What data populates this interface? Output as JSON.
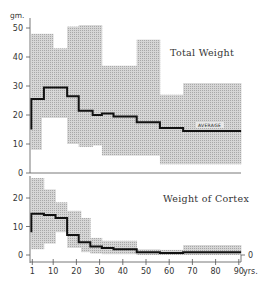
{
  "chart_data": [
    {
      "type": "area",
      "title": "Total Weight",
      "ylabel": "gm.",
      "xlabel": "yrs.",
      "ylim": [
        0,
        52
      ],
      "yticks": [
        0,
        10,
        20,
        30,
        40,
        50
      ],
      "annotation": "AVERAGE",
      "band": {
        "description": "shaded range (min–max)",
        "steps": [
          {
            "x0": 1,
            "x1": 5,
            "low": 8,
            "high": 48
          },
          {
            "x0": 5,
            "x1": 10,
            "low": 19,
            "high": 48
          },
          {
            "x0": 10,
            "x1": 16,
            "low": 19,
            "high": 43
          },
          {
            "x0": 16,
            "x1": 21,
            "low": 10,
            "high": 50.5
          },
          {
            "x0": 21,
            "x1": 27,
            "low": 9,
            "high": 51
          },
          {
            "x0": 27,
            "x1": 31,
            "low": 9.5,
            "high": 51
          },
          {
            "x0": 31,
            "x1": 46,
            "low": 6,
            "high": 37
          },
          {
            "x0": 46,
            "x1": 56,
            "low": 6,
            "high": 46
          },
          {
            "x0": 56,
            "x1": 66,
            "low": 3,
            "high": 27
          },
          {
            "x0": 66,
            "x1": 91,
            "low": 3,
            "high": 31
          }
        ]
      },
      "average": [
        {
          "x0": 1,
          "x1": 6,
          "y": 25.5
        },
        {
          "x0": 6,
          "x1": 16,
          "y": 29.5
        },
        {
          "x0": 16,
          "x1": 21,
          "y": 26.5
        },
        {
          "x0": 21,
          "x1": 27,
          "y": 21.5
        },
        {
          "x0": 27,
          "x1": 31,
          "y": 20
        },
        {
          "x0": 31,
          "x1": 36,
          "y": 20.5
        },
        {
          "x0": 36,
          "x1": 46,
          "y": 19.5
        },
        {
          "x0": 46,
          "x1": 56,
          "y": 17.5
        },
        {
          "x0": 56,
          "x1": 66,
          "y": 15.5
        },
        {
          "x0": 66,
          "x1": 91,
          "y": 14.5
        }
      ],
      "average_start": 15
    },
    {
      "type": "area",
      "title": "Weight of Cortex",
      "ylabel": "",
      "xlabel": "yrs.",
      "ylim": [
        0,
        28
      ],
      "yticks": [
        0,
        10,
        20
      ],
      "right_label": "0",
      "band": {
        "steps": [
          {
            "x0": 1,
            "x1": 6,
            "low": 2,
            "high": 27
          },
          {
            "x0": 6,
            "x1": 11,
            "low": 4,
            "high": 23
          },
          {
            "x0": 11,
            "x1": 16,
            "low": 8,
            "high": 18.5
          },
          {
            "x0": 16,
            "x1": 22,
            "low": 2.5,
            "high": 15.5
          },
          {
            "x0": 22,
            "x1": 26,
            "low": 1,
            "high": 13
          },
          {
            "x0": 26,
            "x1": 31,
            "low": 0.5,
            "high": 6
          },
          {
            "x0": 31,
            "x1": 46,
            "low": 0.3,
            "high": 5
          },
          {
            "x0": 46,
            "x1": 56,
            "low": 0,
            "high": 2
          },
          {
            "x0": 56,
            "x1": 66,
            "low": 0,
            "high": 1.8
          },
          {
            "x0": 66,
            "x1": 91,
            "low": 0,
            "high": 3.5
          }
        ]
      },
      "average": [
        {
          "x0": 1,
          "x1": 6,
          "y": 14.5
        },
        {
          "x0": 6,
          "x1": 11,
          "y": 14
        },
        {
          "x0": 11,
          "x1": 16,
          "y": 13
        },
        {
          "x0": 16,
          "x1": 21,
          "y": 7
        },
        {
          "x0": 21,
          "x1": 26,
          "y": 4.5
        },
        {
          "x0": 26,
          "x1": 31,
          "y": 3
        },
        {
          "x0": 31,
          "x1": 36,
          "y": 2.5
        },
        {
          "x0": 36,
          "x1": 46,
          "y": 2
        },
        {
          "x0": 46,
          "x1": 56,
          "y": 1
        },
        {
          "x0": 56,
          "x1": 66,
          "y": 0.7
        },
        {
          "x0": 66,
          "x1": 91,
          "y": 1
        }
      ],
      "average_start": 8
    }
  ],
  "x_axis": {
    "ticks": [
      1,
      10,
      20,
      30,
      40,
      50,
      60,
      70,
      80,
      90
    ],
    "tick_labels": [
      "1",
      "10",
      "20",
      "30",
      "40",
      "50",
      "60",
      "70",
      "80",
      "90"
    ],
    "unit": "yrs."
  },
  "labels": {
    "y_unit": "gm.",
    "total_title": "Total Weight",
    "cortex_title": "Weight of Cortex",
    "average": "AVERAGE",
    "cortex_zero_right": "0",
    "x_unit": "yrs."
  },
  "colors": {
    "band": "#c9c9c9",
    "band_hatch": "#9a9a9a",
    "line": "#111111",
    "axis": "#444444",
    "text": "#333333"
  }
}
